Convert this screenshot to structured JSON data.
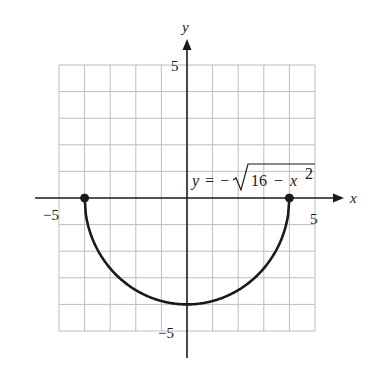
{
  "chart_data": {
    "type": "line",
    "title": "",
    "equation": {
      "lhs": "y",
      "equals": "=",
      "minus": "−",
      "radicand_const": "16",
      "radicand_op": "−",
      "radicand_var": "x",
      "exponent": "2",
      "full": "y = −√(16 − x²)"
    },
    "xlabel": "x",
    "ylabel": "y",
    "xlim": [
      -5,
      5
    ],
    "ylim": [
      -5,
      5
    ],
    "grid": true,
    "grid_step": 1,
    "tick_labels": {
      "x_neg": "−5",
      "x_pos": "5",
      "y_pos": "5",
      "y_neg": "−5"
    },
    "series": [
      {
        "name": "y = −√(16 − x²)",
        "description": "lower semicircle of radius 4 centered at origin",
        "x": [
          -4,
          -3,
          -2,
          -1,
          0,
          1,
          2,
          3,
          4
        ],
        "y": [
          0,
          -2.65,
          -3.46,
          -3.87,
          -4,
          -3.87,
          -3.46,
          -2.65,
          0
        ],
        "color": "#1a1a1a"
      }
    ],
    "endpoints": [
      {
        "x": -4,
        "y": 0,
        "filled": true
      },
      {
        "x": 4,
        "y": 0,
        "filled": true
      }
    ]
  },
  "colors": {
    "grid": "#bdbdbd",
    "axis": "#1a1a1a",
    "curve": "#1a1a1a",
    "background": "#ffffff"
  }
}
